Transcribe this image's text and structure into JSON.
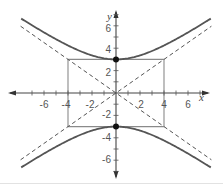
{
  "chart_data": {
    "type": "line",
    "title": "",
    "xlabel": "x",
    "ylabel": "y",
    "xlim": [
      -7.5,
      7.5
    ],
    "ylim": [
      -7,
      7
    ],
    "grid": false,
    "x_tick_labels": [
      "-6",
      "-4",
      "-2",
      "2",
      "4",
      "6"
    ],
    "y_tick_labels": [
      "6",
      "4",
      "2",
      "-2",
      "-4",
      "-6"
    ],
    "x_ticks": [
      -6,
      -4,
      -2,
      2,
      4,
      6
    ],
    "y_ticks": [
      6,
      4,
      2,
      -2,
      -4,
      -6
    ],
    "series": [
      {
        "name": "hyperbola upper branch",
        "equation": "y^2/9 - x^2/16 = 1",
        "style": "solid",
        "color": "#555555"
      },
      {
        "name": "hyperbola lower branch",
        "equation": "y^2/9 - x^2/16 = 1",
        "style": "solid",
        "color": "#555555"
      },
      {
        "name": "asymptote y = 3x/4",
        "style": "dashed",
        "color": "#555555"
      },
      {
        "name": "asymptote y = -3x/4",
        "style": "dashed",
        "color": "#555555"
      },
      {
        "name": "fundamental rectangle",
        "corners": [
          [
            -4,
            -3
          ],
          [
            4,
            -3
          ],
          [
            4,
            3
          ],
          [
            -4,
            3
          ]
        ],
        "style": "solid",
        "color": "#8a8a8a"
      }
    ],
    "points": [
      {
        "label": "vertex",
        "x": 0,
        "y": 3
      },
      {
        "label": "vertex",
        "x": 0,
        "y": -3
      }
    ]
  },
  "labels": {
    "x_axis": "x",
    "y_axis": "y",
    "xt": [
      "-6",
      "-4",
      "-2",
      "2",
      "4",
      "6"
    ],
    "yt": [
      "6",
      "4",
      "2",
      "-2",
      "-4",
      "-6"
    ]
  }
}
